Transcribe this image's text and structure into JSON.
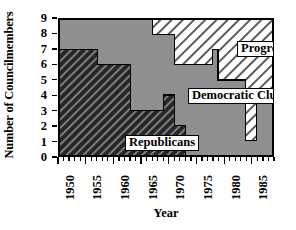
{
  "chart_data": {
    "type": "area",
    "subtype": "stacked-step-area",
    "title": "",
    "xlabel": "Year",
    "ylabel": "Number of Councilmembers",
    "xlim": [
      1950,
      1989
    ],
    "ylim": [
      0,
      9
    ],
    "grid": false,
    "legend_position": "in-plot-labels",
    "ytick_labels": [
      "0",
      "1",
      "2",
      "3",
      "4",
      "5",
      "6",
      "7",
      "8",
      "9"
    ],
    "ytick_values": [
      0,
      1,
      2,
      3,
      4,
      5,
      6,
      7,
      8,
      9
    ],
    "xtick_labels": [
      "1950",
      "1955",
      "1960",
      "1965",
      "1970",
      "1975",
      "1980",
      "1985"
    ],
    "xtick_values": [
      1950,
      1955,
      1960,
      1965,
      1970,
      1975,
      1980,
      1985
    ],
    "xtick_minor_step": 1,
    "total_seats": 9,
    "x": [
      1950,
      1951,
      1952,
      1953,
      1954,
      1955,
      1956,
      1957,
      1958,
      1959,
      1960,
      1961,
      1962,
      1963,
      1964,
      1965,
      1966,
      1967,
      1968,
      1969,
      1970,
      1971,
      1972,
      1973,
      1974,
      1975,
      1976,
      1977,
      1978,
      1979,
      1980,
      1981,
      1982,
      1983,
      1984,
      1985,
      1986,
      1987,
      1988,
      1989
    ],
    "series": [
      {
        "name": "Republicans",
        "fill": "dark-hatch",
        "color": "#2b2b2b",
        "values": [
          7,
          7,
          7,
          7,
          7,
          7,
          7,
          6,
          6,
          6,
          6,
          6,
          6,
          3,
          3,
          3,
          3,
          3,
          3,
          4,
          4,
          2,
          2,
          0,
          0,
          0,
          0,
          0,
          0,
          0,
          0,
          0,
          0,
          0,
          0,
          0,
          0,
          0,
          0,
          0
        ]
      },
      {
        "name": "Democratic Club",
        "fill": "solid-gray",
        "color": "#8f8f8f",
        "values": [
          2,
          2,
          2,
          2,
          2,
          2,
          2,
          3,
          3,
          3,
          3,
          3,
          3,
          6,
          6,
          6,
          6,
          5,
          5,
          4,
          4,
          4,
          4,
          6,
          6,
          6,
          6,
          6,
          7,
          5,
          5,
          5,
          5,
          5,
          1,
          1,
          4,
          4,
          4,
          4
        ]
      },
      {
        "name": "Progressives/BCA",
        "fill": "light-hatch",
        "color": "#ffffff",
        "values": [
          0,
          0,
          0,
          0,
          0,
          0,
          0,
          0,
          0,
          0,
          0,
          0,
          0,
          0,
          0,
          0,
          0,
          1,
          1,
          1,
          1,
          3,
          3,
          3,
          3,
          3,
          3,
          3,
          2,
          4,
          4,
          4,
          4,
          4,
          8,
          8,
          5,
          5,
          5,
          5
        ]
      }
    ],
    "annotations": [
      {
        "name": "Republicans",
        "label": "Republicans"
      },
      {
        "name": "Democratic Club",
        "label": "Democratic Club"
      },
      {
        "name": "Progressives/BCA",
        "label": "Progressives/BCA"
      }
    ]
  },
  "axes": {
    "ylabel": "Number of Councilmembers",
    "xlabel": "Year"
  },
  "labels": {
    "republicans": "Republicans",
    "democratic_club": "Democratic Club",
    "progressives": "Progressives/BCA"
  },
  "colors": {
    "republicans": "#2b2b2b",
    "democratic_club": "#8f8f8f",
    "progressives": "#ffffff",
    "axis": "#000000",
    "background": "#ffffff"
  }
}
